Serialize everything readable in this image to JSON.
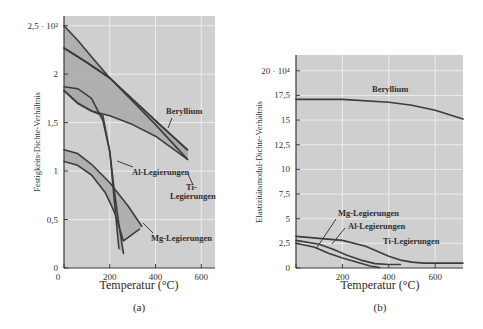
{
  "chart_data": [
    {
      "id": "a",
      "type": "line",
      "caption": "(a)",
      "xlabel": "Temperatur (°C)",
      "ylabel": "Festigkeits-Dichte-Verhältnis",
      "xlim": [
        0,
        660
      ],
      "ylim": [
        0,
        2.5
      ],
      "xticks": [
        0,
        200,
        400,
        600
      ],
      "xtick_labels": [
        "0",
        "200",
        "400",
        "600"
      ],
      "yticks": [
        0,
        0.5,
        1,
        1.5,
        2,
        2.5
      ],
      "ytick_labels": [
        "0",
        "0,5",
        "1",
        "1,5",
        "2",
        "2,5 · 10²"
      ],
      "grid": true,
      "series": [
        {
          "name": "Beryllium",
          "band": true,
          "upper": {
            "x": [
              0,
              100,
              200,
              300,
              400,
              540
            ],
            "y": [
              2.27,
              2.12,
              1.96,
              1.74,
              1.52,
              1.22
            ]
          },
          "lower": {
            "x": [
              0,
              60,
              120,
              200,
              300,
              400,
              540
            ],
            "y": [
              1.83,
              1.7,
              1.62,
              1.57,
              1.48,
              1.36,
              1.12
            ]
          }
        },
        {
          "name": "Ti-Legierungen",
          "band": true,
          "upper": {
            "x": [
              0,
              60,
              120,
              200,
              300,
              400,
              540
            ],
            "y": [
              2.5,
              2.35,
              2.18,
              1.96,
              1.72,
              1.48,
              1.12
            ]
          },
          "lower": {
            "x": [
              0,
              100,
              200,
              300,
              400,
              540
            ],
            "y": [
              2.27,
              2.12,
              1.96,
              1.74,
              1.52,
              1.22
            ]
          }
        },
        {
          "name": "Al-Legierungen",
          "band": true,
          "upper": {
            "x": [
              0,
              60,
              120,
              170,
              200,
              220,
              240,
              260
            ],
            "y": [
              1.87,
              1.85,
              1.75,
              1.52,
              1.2,
              0.8,
              0.45,
              0.15
            ]
          },
          "lower": {
            "x": [
              0,
              60,
              120,
              170,
              200,
              220,
              240
            ],
            "y": [
              1.83,
              1.7,
              1.62,
              1.57,
              1.2,
              0.7,
              0.2
            ]
          }
        },
        {
          "name": "Mg-Legierungen",
          "band": true,
          "upper": {
            "x": [
              0,
              60,
              120,
              200,
              280,
              340
            ],
            "y": [
              1.22,
              1.18,
              1.07,
              0.88,
              0.64,
              0.43
            ]
          },
          "lower": {
            "x": [
              0,
              60,
              120,
              180,
              220,
              260,
              330
            ],
            "y": [
              1.1,
              1.06,
              0.96,
              0.78,
              0.58,
              0.28,
              0.4
            ]
          }
        }
      ],
      "annotations": [
        {
          "text": "Beryllium",
          "x": 410,
          "y": 1.52
        },
        {
          "text": "Al-Legierungen",
          "x": 290,
          "y": 0.88
        },
        {
          "text": "Ti-",
          "x": 560,
          "y": 0.8
        },
        {
          "text": "Legierungen",
          "x": 580,
          "y": 0.72
        },
        {
          "text": "Mg-Legierungen",
          "x": 400,
          "y": 0.25
        }
      ]
    },
    {
      "id": "b",
      "type": "line",
      "caption": "(b)",
      "xlabel": "Temperatur (°C)",
      "ylabel": "Elastizitätsmodul-Dichte-Verhältnis",
      "xlim": [
        0,
        720
      ],
      "ylim": [
        0,
        20
      ],
      "xticks": [
        0,
        200,
        400,
        600
      ],
      "xtick_labels": [
        "",
        "200",
        "400",
        "600"
      ],
      "yticks": [
        0,
        2.5,
        5,
        7.5,
        10,
        12.5,
        15,
        17.5,
        20
      ],
      "ytick_labels": [
        "0",
        "2,5",
        "5",
        "7,5",
        "10",
        "12,5",
        "15",
        "17,5",
        "20 · 10⁴"
      ],
      "grid": true,
      "series": [
        {
          "name": "Beryllium",
          "x": [
            0,
            200,
            400,
            500,
            600,
            720
          ],
          "y": [
            17.1,
            17.1,
            16.8,
            16.5,
            16.0,
            15.1
          ]
        },
        {
          "name": "Ti-Legierungen",
          "x": [
            0,
            100,
            200,
            300,
            350,
            400,
            450,
            500,
            550,
            600,
            720
          ],
          "y": [
            3.2,
            3.0,
            2.8,
            2.2,
            1.7,
            1.2,
            0.8,
            0.6,
            0.5,
            0.5,
            0.5
          ]
        },
        {
          "name": "Al-Legierungen",
          "x": [
            0,
            100,
            160,
            220,
            280,
            340,
            400,
            450
          ],
          "y": [
            2.8,
            2.4,
            1.9,
            1.3,
            0.8,
            0.45,
            0.35,
            0.35
          ]
        },
        {
          "name": "Mg-Legierungen",
          "x": [
            0,
            80,
            140,
            200,
            260,
            320,
            360
          ],
          "y": [
            2.5,
            2.1,
            1.5,
            1.0,
            0.6,
            0.2,
            0.05
          ]
        }
      ],
      "annotations": [
        {
          "text": "Beryllium",
          "x": 270,
          "y": 18.4
        },
        {
          "text": "Mg-Legierungen",
          "x": 90,
          "y": 5.2
        },
        {
          "text": "Al-Legierungen",
          "x": 150,
          "y": 4.2
        },
        {
          "text": "Ti-Legierungen",
          "x": 350,
          "y": 2.9
        }
      ]
    }
  ],
  "labels": {
    "a": {
      "caption": "(a)",
      "xlabel": "Temperatur (°C)",
      "ylabel": "Festigkeits-Dichte-Verhältnis",
      "beryllium": "Beryllium",
      "al": "Al-Legierungen",
      "ti1": "Ti-",
      "ti2": "Legierungen",
      "mg": "Mg-Legierungen",
      "yticks": [
        "0",
        "0,5",
        "1",
        "1,5",
        "2",
        "2,5 · 10²"
      ],
      "xticks": [
        "0",
        "200",
        "400",
        "600"
      ]
    },
    "b": {
      "caption": "(b)",
      "xlabel": "Temperatur (°C)",
      "ylabel": "Elastizitätsmodul-Dichte-Verhältnis",
      "beryllium": "Beryllium",
      "mg": "Mg-Legierungen",
      "al": "Al-Legierungen",
      "ti": "Ti-Legierungen",
      "yticks": [
        "0",
        "2,5",
        "5",
        "7,5",
        "10",
        "12,5",
        "15",
        "17,5",
        "20 · 10⁴"
      ],
      "xticks": [
        "200",
        "400",
        "600"
      ]
    }
  }
}
